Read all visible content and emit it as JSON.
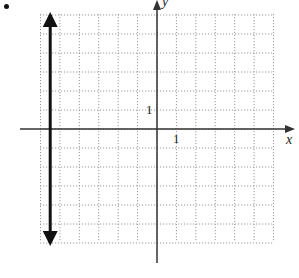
{
  "chart_data": {
    "type": "line",
    "title": "",
    "xlabel": "x",
    "ylabel": "y",
    "xlim": [
      -6,
      6
    ],
    "ylim": [
      -6,
      6
    ],
    "grid": true,
    "grid_style": "dotted",
    "tick_labels": {
      "x": [
        "1"
      ],
      "y": [
        "1"
      ]
    },
    "series": [
      {
        "name": "vertical line",
        "points": [
          {
            "x": -5.5,
            "y": -6
          },
          {
            "x": -5.5,
            "y": 6
          }
        ],
        "arrows": "both",
        "color": "#111111"
      }
    ]
  },
  "labels": {
    "x_axis": "x",
    "y_axis": "y",
    "x_tick": "1",
    "y_tick": "1",
    "bullet": "•"
  },
  "colors": {
    "grid": "#9a9a9a",
    "axis": "#333333",
    "line": "#111111"
  }
}
